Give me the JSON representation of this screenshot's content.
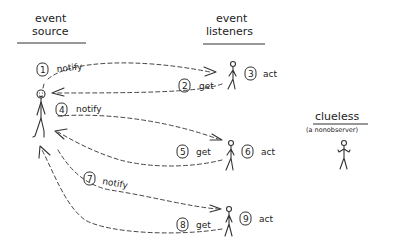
{
  "headings": {
    "source_line1": "event",
    "source_line2": "source",
    "listeners_line1": "event",
    "listeners_line2": "listeners",
    "clueless": "clueless",
    "clueless_sub": "(a nonobserver)"
  },
  "steps": [
    {
      "num": "1",
      "label": "notify"
    },
    {
      "num": "2",
      "label": "get"
    },
    {
      "num": "3",
      "label": "act"
    },
    {
      "num": "4",
      "label": "notify"
    },
    {
      "num": "5",
      "label": "get"
    },
    {
      "num": "6",
      "label": "act"
    },
    {
      "num": "7",
      "label": "notify"
    },
    {
      "num": "8",
      "label": "get"
    },
    {
      "num": "9",
      "label": "act"
    }
  ],
  "figures": {
    "source": "stick-figure-event-source",
    "listeners": [
      "listener-1",
      "listener-2",
      "listener-3"
    ],
    "nonobserver": "stick-figure-clueless"
  },
  "colors": {
    "ink": "#333333",
    "background": "#ffffff"
  }
}
